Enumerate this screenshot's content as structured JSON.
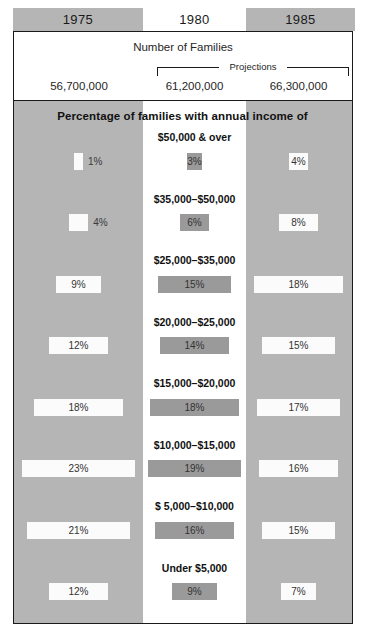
{
  "columns": [
    {
      "year": "1975",
      "families": "56,700,000",
      "projection": false
    },
    {
      "year": "1980",
      "families": "61,200,000",
      "projection": true
    },
    {
      "year": "1985",
      "families": "66,300,000",
      "projection": true
    }
  ],
  "header": {
    "families_title": "Number of Families",
    "projections_label": "Projections"
  },
  "body": {
    "heading": "Percentage of families with annual income of"
  },
  "chart_data": {
    "type": "bar",
    "title": "Percentage of families with annual income of",
    "subtitle": "Number of Families",
    "orientation": "horizontal",
    "grid": false,
    "legend": "column headers",
    "xlabel": "",
    "ylabel": "",
    "xlim": [
      0,
      25
    ],
    "categories": [
      "$50,000 & over",
      "$35,000–$50,000",
      "$25,000–$35,000",
      "$20,000–$25,000",
      "$15,000–$20,000",
      "$10,000–$15,000",
      "$  5,000–$10,000",
      "Under $5,000"
    ],
    "series": [
      {
        "name": "1975",
        "total_families": "56,700,000",
        "values": [
          1,
          4,
          9,
          12,
          18,
          23,
          21,
          12
        ],
        "labels": [
          "1%",
          "4%",
          "9%",
          "12%",
          "18%",
          "23%",
          "21%",
          "12%"
        ]
      },
      {
        "name": "1980",
        "total_families": "61,200,000",
        "values": [
          3,
          6,
          15,
          14,
          18,
          19,
          16,
          9
        ],
        "labels": [
          "3%",
          "6%",
          "15%",
          "14%",
          "18%",
          "19%",
          "16%",
          "9%"
        ]
      },
      {
        "name": "1985",
        "total_families": "66,300,000",
        "values": [
          4,
          8,
          18,
          15,
          17,
          16,
          15,
          7
        ],
        "labels": [
          "4%",
          "8%",
          "18%",
          "15%",
          "17%",
          "16%",
          "15%",
          "7%"
        ]
      }
    ],
    "colors": {
      "panel_background": "#b5b5b5",
      "middle_column_background": "#ffffff",
      "bar_light": "#fbfbfb",
      "bar_dark": "#9a9a9a",
      "border": "#1a1a1a",
      "text": "#111111"
    }
  }
}
